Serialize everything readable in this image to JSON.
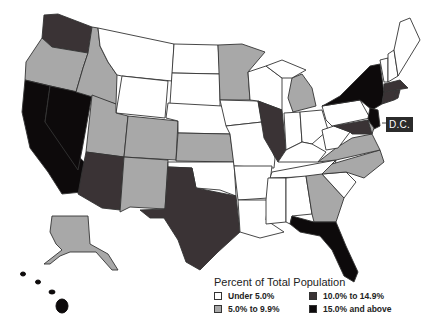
{
  "map": {
    "title": "Percent of Total Population",
    "region": "United States",
    "dc_label": "D.C.",
    "colors": {
      "under_5": "#ffffff",
      "5_to_9_9": "#a8a8a8",
      "10_to_14_9": "#3a3335",
      "15_and_above": "#0d0a0b"
    },
    "states": {
      "WA": "10_to_14_9",
      "OR": "5_to_9_9",
      "CA": "15_and_above",
      "NV": "15_and_above",
      "ID": "5_to_9_9",
      "MT": "under_5",
      "WY": "under_5",
      "UT": "5_to_9_9",
      "AZ": "10_to_14_9",
      "CO": "5_to_9_9",
      "NM": "5_to_9_9",
      "ND": "under_5",
      "SD": "under_5",
      "NE": "under_5",
      "KS": "5_to_9_9",
      "OK": "under_5",
      "TX": "10_to_14_9",
      "MN": "5_to_9_9",
      "IA": "under_5",
      "MO": "under_5",
      "AR": "under_5",
      "LA": "under_5",
      "WI": "under_5",
      "IL": "10_to_14_9",
      "MI": "5_to_9_9",
      "IN": "under_5",
      "OH": "under_5",
      "KY": "under_5",
      "TN": "under_5",
      "MS": "under_5",
      "AL": "under_5",
      "GA": "5_to_9_9",
      "FL": "15_and_above",
      "SC": "under_5",
      "NC": "5_to_9_9",
      "VA": "5_to_9_9",
      "WV": "under_5",
      "PA": "under_5",
      "NY": "15_and_above",
      "VT": "under_5",
      "NH": "under_5",
      "ME": "under_5",
      "MA": "10_to_14_9",
      "CT": "10_to_14_9",
      "RI": "10_to_14_9",
      "NJ": "15_and_above",
      "DE": "5_to_9_9",
      "MD": "10_to_14_9",
      "AK": "5_to_9_9",
      "HI": "15_and_above",
      "DC": "10_to_14_9"
    }
  },
  "legend": {
    "title": "Percent of Total Population",
    "items": [
      {
        "label": "Under 5.0%",
        "color": "#ffffff"
      },
      {
        "label": "10.0% to 14.9%",
        "color": "#3a3335"
      },
      {
        "label": "5.0% to 9.9%",
        "color": "#a8a8a8"
      },
      {
        "label": "15.0% and above",
        "color": "#0d0a0b"
      }
    ]
  }
}
